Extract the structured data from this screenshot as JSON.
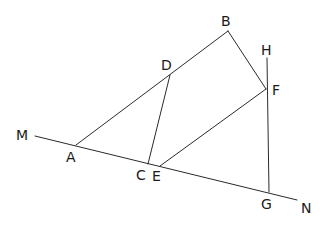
{
  "diagram": {
    "type": "geometry",
    "points": {
      "M": {
        "label": "M"
      },
      "A": {
        "label": "A"
      },
      "B": {
        "label": "B"
      },
      "C": {
        "label": "C"
      },
      "D": {
        "label": "D"
      },
      "E": {
        "label": "E"
      },
      "F": {
        "label": "F"
      },
      "G": {
        "label": "G"
      },
      "H": {
        "label": "H"
      },
      "N": {
        "label": "N"
      }
    },
    "segments": [
      {
        "name": "line-MN",
        "from": "M",
        "to": "N"
      },
      {
        "name": "segment-AB",
        "from": "A",
        "to": "B"
      },
      {
        "name": "segment-BF",
        "from": "B",
        "to": "F"
      },
      {
        "name": "segment-DC",
        "from": "D",
        "to": "C"
      },
      {
        "name": "segment-EF",
        "from": "E",
        "to": "F"
      },
      {
        "name": "segment-HG",
        "from": "H",
        "to": "G"
      }
    ]
  }
}
